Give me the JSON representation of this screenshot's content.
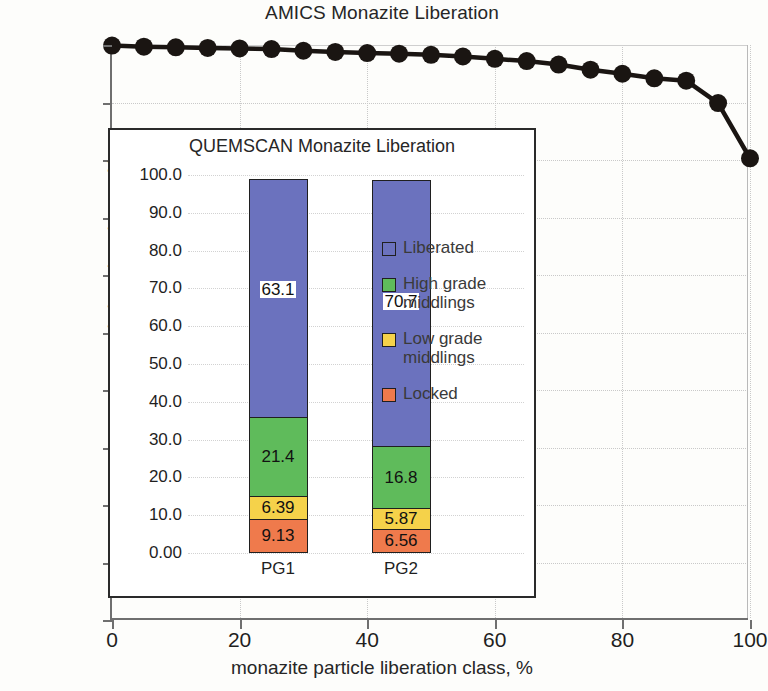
{
  "chart_data": [
    {
      "type": "scatter",
      "id": "amics-main",
      "title": "AMICS Monazite Liberation",
      "xlabel": "monazite particle liberation class, %",
      "ylabel": "cumulative abundance, %",
      "xlim": [
        0,
        100
      ],
      "ylim": [
        0,
        100
      ],
      "xticks": [
        "0",
        "20",
        "40",
        "60",
        "80",
        "100"
      ],
      "xtick_values": [
        0,
        20,
        40,
        60,
        80,
        100
      ],
      "yticks": [
        "0",
        "10",
        "20",
        "30",
        "40",
        "50",
        "60",
        "70",
        "80",
        "90",
        "100"
      ],
      "ytick_values": [
        0,
        10,
        20,
        30,
        40,
        50,
        60,
        70,
        80,
        90,
        100
      ],
      "grid": true,
      "legend": "none",
      "marker": "filled-circle",
      "marker_color": "#1a1512",
      "line_color": "#1a1512",
      "x": [
        0,
        5,
        10,
        15,
        20,
        25,
        30,
        35,
        40,
        45,
        50,
        55,
        60,
        65,
        70,
        75,
        80,
        85,
        90,
        95,
        100
      ],
      "values": [
        99.9,
        99.7,
        99.6,
        99.5,
        99.4,
        99.3,
        99.0,
        98.8,
        98.6,
        98.5,
        98.3,
        98.0,
        97.6,
        97.2,
        96.6,
        95.7,
        95.0,
        94.2,
        93.8,
        89.9,
        80.3
      ]
    },
    {
      "type": "bar",
      "id": "quemscan-inset",
      "stacked": true,
      "title": "QUEMSCAN Monazite Liberation",
      "xlabel": "",
      "ylabel": "",
      "ylim": [
        0,
        100
      ],
      "yticks": [
        "0.00",
        "10.0",
        "20.0",
        "30.0",
        "40.0",
        "50.0",
        "60.0",
        "70.0",
        "80.0",
        "90.0",
        "100.0"
      ],
      "ytick_values": [
        0,
        10,
        20,
        30,
        40,
        50,
        60,
        70,
        80,
        90,
        100
      ],
      "grid": true,
      "legend_position": "right",
      "categories": [
        "PG1",
        "PG2"
      ],
      "series": [
        {
          "name": "Locked",
          "color": "#EF7A4C",
          "values": [
            9.13,
            6.56
          ],
          "labels": [
            "9.13",
            "6.56"
          ]
        },
        {
          "name": "Low grade middlings",
          "color": "#F5D24A",
          "values": [
            6.39,
            5.87
          ],
          "labels": [
            "6.39",
            "5.87"
          ]
        },
        {
          "name": "High grade middlings",
          "color": "#5FBB5B",
          "values": [
            21.4,
            16.8
          ],
          "labels": [
            "21.4",
            "16.8"
          ]
        },
        {
          "name": "Liberated",
          "color": "#6B72BE",
          "values": [
            63.1,
            70.7
          ],
          "labels": [
            "63.1",
            "70.7"
          ]
        }
      ],
      "legend_order": [
        "Liberated",
        "High grade middlings",
        "Low grade middlings",
        "Locked"
      ]
    }
  ],
  "main": {
    "title": "AMICS Monazite Liberation",
    "xlabel": "monazite particle liberation class, %",
    "ylabel": "cumulative abundance, %"
  },
  "inset": {
    "title": "QUEMSCAN Monazite Liberation"
  }
}
